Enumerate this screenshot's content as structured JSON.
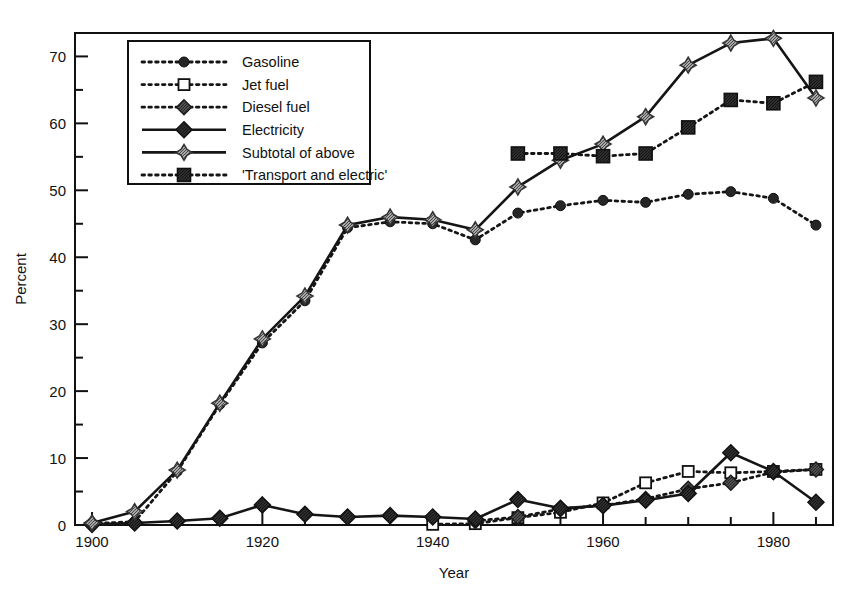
{
  "chart_data": {
    "type": "line",
    "title": "",
    "subtitle": "",
    "xlabel": "Year",
    "ylabel": "Percent",
    "xlim": [
      1898,
      1987
    ],
    "ylim": [
      0,
      73.5
    ],
    "grid": false,
    "legend_position": "top-left-inside",
    "x_ticks_major": [
      1900,
      1920,
      1940,
      1960,
      1980
    ],
    "x_ticks_minor": [
      1905,
      1910,
      1915,
      1925,
      1930,
      1935,
      1945,
      1950,
      1955,
      1965,
      1970,
      1975,
      1985
    ],
    "y_ticks_major": [
      0,
      10,
      20,
      30,
      40,
      50,
      60,
      70
    ],
    "y_ticks_minor": [
      5,
      15,
      25,
      35,
      45,
      55,
      65
    ],
    "x_tick_labels": [
      "1900",
      "1920",
      "1940",
      "1960",
      "1980"
    ],
    "y_tick_labels": [
      "0",
      "10",
      "20",
      "30",
      "40",
      "50",
      "60",
      "70"
    ],
    "series": [
      {
        "name": "Gasoline",
        "marker": "filled-circle",
        "line": "dotted",
        "color": "#262626",
        "x": [
          1900,
          1905,
          1910,
          1915,
          1920,
          1925,
          1930,
          1935,
          1940,
          1945,
          1950,
          1955,
          1960,
          1965,
          1970,
          1975,
          1980,
          1985
        ],
        "values": [
          0.2,
          0.5,
          8.0,
          18.0,
          27.2,
          33.5,
          44.4,
          45.3,
          45.0,
          42.6,
          46.6,
          47.7,
          48.5,
          48.2,
          49.4,
          49.8,
          48.8,
          44.8
        ]
      },
      {
        "name": "Jet fuel",
        "marker": "open-square",
        "line": "dotted",
        "color": "#1a1a1a",
        "x": [
          1940,
          1945,
          1950,
          1955,
          1960,
          1965,
          1970,
          1975,
          1980,
          1985
        ],
        "values": [
          0.1,
          0.2,
          1.1,
          1.9,
          3.3,
          6.3,
          8.0,
          7.8,
          8.0,
          8.3
        ]
      },
      {
        "name": "Diesel fuel",
        "marker": "gray-diamond",
        "line": "dotted",
        "color": "#555555",
        "x": [
          1945,
          1950,
          1955,
          1960,
          1965,
          1970,
          1975,
          1980,
          1985
        ],
        "values": [
          0.6,
          1.2,
          2.4,
          2.9,
          3.9,
          5.4,
          6.3,
          7.9,
          8.3
        ]
      },
      {
        "name": "Electricity",
        "marker": "dark-diamond",
        "line": "solid",
        "color": "#3a3a3a",
        "x": [
          1900,
          1905,
          1910,
          1915,
          1920,
          1925,
          1930,
          1935,
          1940,
          1945,
          1950,
          1955,
          1960,
          1965,
          1970,
          1975,
          1980,
          1985
        ],
        "values": [
          0.1,
          0.3,
          0.6,
          1.0,
          3.0,
          1.6,
          1.2,
          1.4,
          1.2,
          0.9,
          3.8,
          2.5,
          2.9,
          3.7,
          4.7,
          10.8,
          8.0,
          3.4
        ]
      },
      {
        "name": "Subtotal of above",
        "marker": "hatched-star-diamond",
        "line": "solid",
        "color": "#4a4a4a",
        "x": [
          1900,
          1905,
          1910,
          1915,
          1920,
          1925,
          1930,
          1935,
          1940,
          1945,
          1950,
          1955,
          1960,
          1965,
          1970,
          1975,
          1980,
          1985
        ],
        "values": [
          0.3,
          2.0,
          8.2,
          18.2,
          27.8,
          34.2,
          44.8,
          46.0,
          45.6,
          44.1,
          50.5,
          54.5,
          56.9,
          61.0,
          68.7,
          72.0,
          72.7,
          63.8
        ]
      },
      {
        "name": "'Transport and electric'",
        "marker": "dark-square",
        "line": "dotted",
        "color": "#3f3f3f",
        "x": [
          1950,
          1955,
          1960,
          1965,
          1970,
          1975,
          1980,
          1985
        ],
        "values": [
          55.5,
          55.5,
          55.1,
          55.5,
          59.4,
          63.5,
          63.0,
          66.2
        ]
      }
    ]
  },
  "legend": {
    "items": [
      {
        "label": "Gasoline",
        "marker": "filled-circle",
        "line": "dotted"
      },
      {
        "label": "Jet fuel",
        "marker": "open-square",
        "line": "dotted"
      },
      {
        "label": "Diesel fuel",
        "marker": "gray-diamond",
        "line": "dotted"
      },
      {
        "label": "Electricity",
        "marker": "dark-diamond",
        "line": "solid"
      },
      {
        "label": "Subtotal of above",
        "marker": "hatched-star-diamond",
        "line": "solid"
      },
      {
        "label": "'Transport and electric'",
        "marker": "dark-square",
        "line": "dotted"
      }
    ]
  },
  "axes": {
    "x_title": "Year",
    "y_title": "Percent"
  }
}
